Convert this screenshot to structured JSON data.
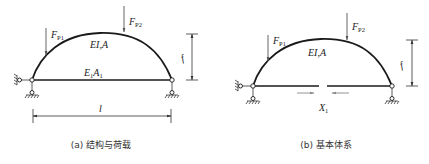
{
  "panel_a": {
    "caption": "(a) 结构与荷载",
    "load_1": {
      "base": "F",
      "sub": "P1"
    },
    "load_2": {
      "base": "F",
      "sub": "P2"
    },
    "arch_label": "EI,A",
    "tie_label": {
      "base1": "E",
      "sub1": "1",
      "base2": "A",
      "sub2": "1"
    },
    "rise_label": "f",
    "span_label": "l"
  },
  "panel_b": {
    "caption": "(b) 基本体系",
    "load_1": {
      "base": "F",
      "sub": "P1"
    },
    "load_2": {
      "base": "F",
      "sub": "P2"
    },
    "arch_label": "EI,A",
    "rise_label": "f",
    "redundant_label": {
      "base": "X",
      "sub": "1"
    }
  },
  "colors": {
    "member": "#1a1a1a",
    "load_arrow": "#555555",
    "redundant_arrow": "#888888"
  }
}
